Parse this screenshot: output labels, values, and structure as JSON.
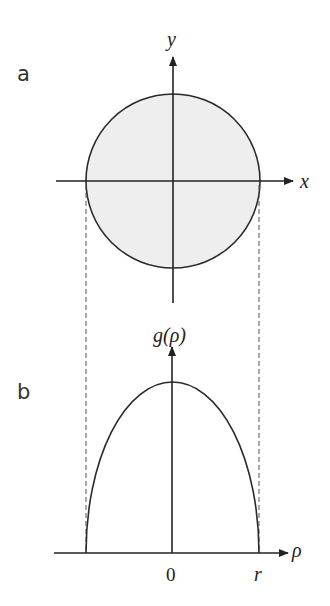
{
  "panels": {
    "a": {
      "label": "a",
      "x_axis_label": "x",
      "y_axis_label": "y",
      "shape": "filled circle",
      "fill_color": "#eeeeee"
    },
    "b": {
      "label": "b",
      "y_axis_label": "g(ρ)",
      "x_axis_label": "ρ",
      "tick_labels": [
        "0",
        "r"
      ],
      "curve": "semi-ellipse from -r to r"
    }
  },
  "colors": {
    "stroke": "#222222",
    "fill": "#eeeeee",
    "dash": "#555555"
  }
}
